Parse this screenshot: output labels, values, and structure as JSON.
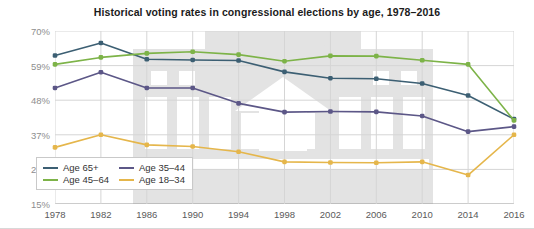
{
  "chart_data": {
    "type": "line",
    "title": "Historical voting rates in congressional elections by age, 1978–2016",
    "xlabel": "",
    "ylabel": "",
    "x": [
      1978,
      1982,
      1986,
      1990,
      1994,
      1998,
      2002,
      2006,
      2010,
      2014,
      2016
    ],
    "categories": [
      "1978",
      "1982",
      "1986",
      "1990",
      "1994",
      "1998",
      "2002",
      "2006",
      "2010",
      "2014",
      "2016"
    ],
    "xlim": [
      1978,
      2016
    ],
    "ylim": [
      15,
      70
    ],
    "yticks": [
      15,
      26,
      37,
      48,
      59,
      70
    ],
    "ytick_labels": [
      "15%",
      "26%",
      "37%",
      "48%",
      "59%",
      "70%"
    ],
    "grid": true,
    "legend_position": "bottom-left",
    "series": [
      {
        "name": "Age 65+",
        "color": "#3c5f73",
        "values": [
          62.2,
          66.2,
          61.0,
          60.8,
          60.6,
          57.0,
          55.0,
          54.8,
          53.3,
          49.5,
          42.0
        ]
      },
      {
        "name": "Age 45–64",
        "color": "#7db348",
        "values": [
          59.4,
          61.6,
          62.9,
          63.4,
          62.5,
          60.4,
          62.1,
          62.0,
          60.7,
          59.4,
          41.6
        ]
      },
      {
        "name": "Age 35–44",
        "color": "#5c5787",
        "values": [
          51.9,
          56.9,
          51.9,
          51.9,
          47.0,
          44.2,
          44.4,
          44.3,
          43.0,
          38.0,
          39.6
        ]
      },
      {
        "name": "Age 18–34",
        "color": "#e5b64b",
        "values": [
          33.0,
          37.0,
          33.8,
          33.3,
          31.6,
          28.4,
          28.2,
          28.1,
          28.4,
          24.2,
          37.0
        ]
      }
    ]
  },
  "legend": {
    "items": [
      {
        "label": "Age 65+",
        "color": "#3c5f73"
      },
      {
        "label": "Age 35–44",
        "color": "#5c5787"
      },
      {
        "label": "Age 45–64",
        "color": "#7db348"
      },
      {
        "label": "Age 18–34",
        "color": "#e5b64b"
      }
    ]
  }
}
